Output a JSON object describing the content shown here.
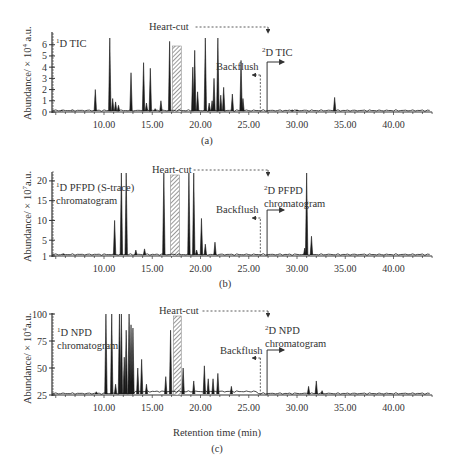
{
  "chart_data": [
    {
      "type": "line",
      "panel": "(a)",
      "title": "1D TIC",
      "ylabel": "Abundance/ × 10^4 a.u.",
      "xlabel": "",
      "xticks": [
        "10.00",
        "15.00",
        "20.00",
        "25.00",
        "30.00",
        "35.00",
        "40.00"
      ],
      "yticks": [
        "0",
        "1",
        "2",
        "3",
        "4",
        "5",
        "6"
      ],
      "xlim": [
        4.7,
        44
      ],
      "ylim": [
        0,
        6.6
      ],
      "annotations": {
        "heart_cut": "Heart-cut",
        "backflush": "Backflush",
        "second_dim": "2D TIC"
      },
      "heart_cut_window": [
        17.0,
        18.0
      ],
      "backflush_time": 26.2,
      "second_dim_start": 26.9,
      "peaks": [
        {
          "t": 5.6,
          "h": 0.15
        },
        {
          "t": 6.7,
          "h": 0.1
        },
        {
          "t": 9.1,
          "h": 2.0
        },
        {
          "t": 10.6,
          "h": 6.6
        },
        {
          "t": 10.9,
          "h": 1.2
        },
        {
          "t": 11.2,
          "h": 0.9
        },
        {
          "t": 11.5,
          "h": 0.6
        },
        {
          "t": 12.8,
          "h": 3.5
        },
        {
          "t": 14.1,
          "h": 4.4
        },
        {
          "t": 14.4,
          "h": 0.8
        },
        {
          "t": 14.8,
          "h": 3.9
        },
        {
          "t": 15.3,
          "h": 0.3
        },
        {
          "t": 15.9,
          "h": 1.0
        },
        {
          "t": 16.8,
          "h": 6.3
        },
        {
          "t": 19.2,
          "h": 4.0
        },
        {
          "t": 19.4,
          "h": 5.5
        },
        {
          "t": 19.7,
          "h": 1.8
        },
        {
          "t": 20.5,
          "h": 6.8
        },
        {
          "t": 20.9,
          "h": 0.8
        },
        {
          "t": 21.2,
          "h": 1.0
        },
        {
          "t": 21.4,
          "h": 3.0
        },
        {
          "t": 21.8,
          "h": 6.7
        },
        {
          "t": 22.1,
          "h": 1.5
        },
        {
          "t": 22.4,
          "h": 2.2
        },
        {
          "t": 23.3,
          "h": 1.6
        },
        {
          "t": 24.2,
          "h": 4.6
        },
        {
          "t": 24.4,
          "h": 1.2
        },
        {
          "t": 29.5,
          "h": 0.2
        },
        {
          "t": 30.0,
          "h": 0.2
        },
        {
          "t": 33.9,
          "h": 1.3
        }
      ]
    },
    {
      "type": "line",
      "panel": "(b)",
      "title": "1D PFPD (S-trace) chromatogram",
      "ylabel": "Abundance/ × 10^7 a.u.",
      "xlabel": "",
      "xticks": [
        "10.00",
        "15.00",
        "20.00",
        "25.00",
        "30.00",
        "35.00",
        "40.00"
      ],
      "yticks": [
        "1",
        "5",
        "10",
        "15",
        "20"
      ],
      "xlim": [
        4.7,
        44
      ],
      "ylim": [
        1,
        22
      ],
      "annotations": {
        "heart_cut": "Heart-cut",
        "backflush": "Backflush",
        "second_dim": "2D PFPD chromatogram"
      },
      "heart_cut_window": [
        16.8,
        17.8
      ],
      "backflush_time": 26.2,
      "second_dim_start": 26.9,
      "peaks": [
        {
          "t": 5.8,
          "h": 1.5
        },
        {
          "t": 11.1,
          "h": 10.0
        },
        {
          "t": 11.8,
          "h": 22
        },
        {
          "t": 12.3,
          "h": 22
        },
        {
          "t": 13.3,
          "h": 2.5
        },
        {
          "t": 14.2,
          "h": 2.8
        },
        {
          "t": 16.2,
          "h": 22
        },
        {
          "t": 18.8,
          "h": 22
        },
        {
          "t": 19.3,
          "h": 22
        },
        {
          "t": 19.6,
          "h": 2.5
        },
        {
          "t": 20.1,
          "h": 10.5
        },
        {
          "t": 20.5,
          "h": 4.0
        },
        {
          "t": 21.5,
          "h": 4.5
        },
        {
          "t": 30.8,
          "h": 3.0
        },
        {
          "t": 31.0,
          "h": 22
        },
        {
          "t": 31.5,
          "h": 6.0
        }
      ]
    },
    {
      "type": "line",
      "panel": "(c)",
      "title": "1D NPD chromatogram",
      "ylabel": "Abundance/ × 10^4 a.u.",
      "xlabel": "Retention time (min)",
      "xticks": [
        "10.00",
        "15.00",
        "20.00",
        "25.00",
        "30.00",
        "35.00",
        "40.00"
      ],
      "yticks": [
        "25",
        "50",
        "75",
        "100"
      ],
      "xlim": [
        4.7,
        44
      ],
      "ylim": [
        25,
        100
      ],
      "annotations": {
        "heart_cut": "Heart-cut",
        "backflush": "Backflush",
        "second_dim": "2D NPD chromatogram"
      },
      "heart_cut_window": [
        17.1,
        18.0
      ],
      "backflush_time": 26.2,
      "second_dim_start": 26.9,
      "peaks": [
        {
          "t": 9.2,
          "h": 28
        },
        {
          "t": 10.2,
          "h": 100
        },
        {
          "t": 10.8,
          "h": 100
        },
        {
          "t": 11.2,
          "h": 35
        },
        {
          "t": 11.6,
          "h": 100
        },
        {
          "t": 11.8,
          "h": 100
        },
        {
          "t": 12.1,
          "h": 60
        },
        {
          "t": 12.3,
          "h": 85
        },
        {
          "t": 12.6,
          "h": 100
        },
        {
          "t": 12.8,
          "h": 90
        },
        {
          "t": 13.0,
          "h": 87
        },
        {
          "t": 13.5,
          "h": 50
        },
        {
          "t": 13.9,
          "h": 58
        },
        {
          "t": 14.4,
          "h": 35
        },
        {
          "t": 16.4,
          "h": 42
        },
        {
          "t": 16.9,
          "h": 85
        },
        {
          "t": 18.2,
          "h": 50
        },
        {
          "t": 19.3,
          "h": 38
        },
        {
          "t": 20.4,
          "h": 52
        },
        {
          "t": 20.8,
          "h": 40
        },
        {
          "t": 21.3,
          "h": 40
        },
        {
          "t": 21.8,
          "h": 45
        },
        {
          "t": 23.2,
          "h": 33
        },
        {
          "t": 31.2,
          "h": 33
        },
        {
          "t": 32.0,
          "h": 38
        },
        {
          "t": 32.6,
          "h": 29
        }
      ]
    }
  ],
  "panels": {
    "a": {
      "caption": "(a)",
      "trace_label_main": "D TIC",
      "trace_label_sup": "1",
      "heart_cut": "Heart-cut",
      "backflush": "Backflush",
      "second_label_sup": "2",
      "second_label_lines": [
        "D TIC"
      ],
      "ylabel_pre": "Abundance/ × 10",
      "ylabel_sup": "4",
      "ylabel_post": " a.u."
    },
    "b": {
      "caption": "(b)",
      "trace_label_sup": "1",
      "trace_label_lines": [
        "D PFPD (S-trace)",
        "chromatogram"
      ],
      "heart_cut": "Heart-cut",
      "backflush": "Backflush",
      "second_label_sup": "2",
      "second_label_lines": [
        "D PFPD",
        "chromatogram"
      ],
      "ylabel_pre": "Abundance/ × 10",
      "ylabel_sup": "7",
      "ylabel_post": "a.u."
    },
    "c": {
      "caption": "(c)",
      "trace_label_sup": "1",
      "trace_label_lines": [
        "D NPD",
        "chromatogram"
      ],
      "heart_cut": "Heart-cut",
      "backflush": "Backflush",
      "second_label_sup": "2",
      "second_label_lines": [
        "D NPD",
        "chromatogram"
      ],
      "ylabel_pre": "Abundance/ × 10",
      "ylabel_sup": "4",
      "ylabel_post": "a.u.",
      "xlabel": "Retention time (min)"
    }
  },
  "xticks": [
    "10.00",
    "15.00",
    "20.00",
    "25.00",
    "30.00",
    "35.00",
    "40.00"
  ],
  "colors": {
    "trace": "#1a1a1a",
    "axis": "#333333",
    "hatch": "#555555"
  }
}
